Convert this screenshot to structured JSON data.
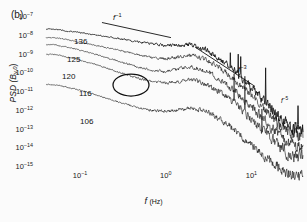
{
  "panel": {
    "label": "(b)"
  },
  "axes": {
    "ylabel_text": "PSD (B",
    "ylabel_sub": "y,0",
    "ylabel_close": ")",
    "xlabel_symbol": "f",
    "xlabel_unit": "(Hz)",
    "yticks": [
      {
        "mantissa": "10",
        "exp": "−7",
        "value": 1e-07
      },
      {
        "mantissa": "10",
        "exp": "−8",
        "value": 1e-08
      },
      {
        "mantissa": "10",
        "exp": "−9",
        "value": 1e-09
      },
      {
        "mantissa": "10",
        "exp": "−10",
        "value": 1e-10
      },
      {
        "mantissa": "10",
        "exp": "−11",
        "value": 1e-11
      },
      {
        "mantissa": "10",
        "exp": "−12",
        "value": 1e-12
      },
      {
        "mantissa": "10",
        "exp": "−13",
        "value": 1e-13
      },
      {
        "mantissa": "10",
        "exp": "−14",
        "value": 1e-14
      },
      {
        "mantissa": "10",
        "exp": "−15",
        "value": 1e-15
      }
    ],
    "xticks": [
      {
        "mantissa": "10",
        "exp": "−1",
        "value": 0.1
      },
      {
        "mantissa": "10",
        "exp": "0",
        "value": 1
      },
      {
        "mantissa": "10",
        "exp": "1",
        "value": 10
      }
    ]
  },
  "curve_labels": [
    {
      "text": "136",
      "x": 74,
      "y": 37
    },
    {
      "text": "125",
      "x": 67,
      "y": 55
    },
    {
      "text": "120",
      "x": 62,
      "y": 72
    },
    {
      "text": "116",
      "x": 79,
      "y": 89
    },
    {
      "text": "106",
      "x": 80,
      "y": 117
    }
  ],
  "slope_annotations": [
    {
      "symbol": "f",
      "exp": "−1",
      "x": 113,
      "y": 12,
      "size": "normal"
    },
    {
      "symbol": "f",
      "exp": "−3",
      "x": 238,
      "y": 64,
      "size": "normal"
    },
    {
      "symbol": "f",
      "exp": "−5",
      "x": 281,
      "y": 96,
      "size": "small"
    }
  ],
  "chart_data": {
    "type": "line",
    "title": "",
    "subtitle": "",
    "panel": "(b)",
    "xlabel": "f (Hz)",
    "ylabel": "PSD (B_y,0)",
    "xscale": "log",
    "yscale": "log",
    "xlim": [
      0.04,
      40
    ],
    "ylim": [
      1e-15,
      1e-07
    ],
    "grid": false,
    "legend_position": "inline-curve-labels",
    "xticklabels": [
      "10^-1",
      "10^0",
      "10^1"
    ],
    "yticklabels": [
      "10^-7",
      "10^-8",
      "10^-9",
      "10^-10",
      "10^-11",
      "10^-12",
      "10^-13",
      "10^-14",
      "10^-15"
    ],
    "noise_note": "all traces are broadband noisy spectra; values are smoothed trend estimates read off the axes",
    "x": [
      0.05,
      0.07,
      0.1,
      0.15,
      0.2,
      0.3,
      0.5,
      0.7,
      1.0,
      1.5,
      2.0,
      3.0,
      5.0,
      7.0,
      10.0,
      15.0,
      20.0,
      30.0
    ],
    "series": [
      {
        "name": "136",
        "label": "136",
        "style": "solid-thick",
        "values": [
          2e-08,
          1.6e-08,
          1.3e-08,
          1e-08,
          8e-09,
          6e-09,
          4e-09,
          3.2e-09,
          2.6e-09,
          2.8e-09,
          3e-09,
          1.5e-09,
          3e-10,
          8e-11,
          1.5e-11,
          2e-12,
          6e-13,
          1e-13
        ]
      },
      {
        "name": "125",
        "label": "125",
        "style": "solid-thin",
        "values": [
          7e-09,
          5.5e-09,
          4e-09,
          2.8e-09,
          2.1e-09,
          1.4e-09,
          8e-10,
          6e-10,
          5e-10,
          7e-10,
          9e-10,
          5e-10,
          1e-10,
          2.5e-11,
          5e-12,
          7e-13,
          2e-13,
          4e-14
        ]
      },
      {
        "name": "120",
        "label": "120",
        "style": "solid-thin",
        "values": [
          3e-09,
          2.2e-09,
          1.5e-09,
          9e-10,
          6e-10,
          3.5e-10,
          1.8e-10,
          1.3e-10,
          1.1e-10,
          1.6e-10,
          2e-10,
          1.2e-10,
          2.5e-11,
          7e-12,
          1.4e-12,
          2e-13,
          6e-14,
          1.2e-14
        ]
      },
      {
        "name": "116",
        "label": "116",
        "style": "solid-thin",
        "values": [
          9e-10,
          6.5e-10,
          4.5e-10,
          2.6e-10,
          1.7e-10,
          9e-11,
          4.5e-11,
          3.2e-11,
          2.6e-11,
          3.4e-11,
          4e-11,
          2.4e-11,
          5.5e-12,
          1.5e-12,
          3e-13,
          5e-14,
          1.5e-14,
          3e-15
        ]
      },
      {
        "name": "106",
        "label": "106",
        "style": "solid-thin",
        "values": [
          2.2e-11,
          1.6e-11,
          1.1e-11,
          6.5e-12,
          4.2e-12,
          2.4e-12,
          1.2e-12,
          9e-13,
          8e-13,
          1e-12,
          1.2e-12,
          8e-13,
          2e-13,
          6e-14,
          1.3e-14,
          2.5e-15,
          1e-15,
          3e-16
        ]
      }
    ],
    "reference_lines": [
      {
        "label": "f^-1",
        "slope": -1,
        "x_range": [
          0.18,
          1.15
        ],
        "y_start": 4.5e-08
      },
      {
        "label": "f^-3",
        "slope": -3,
        "x_range": [
          2.2,
          11.0
        ],
        "y_start": 2.2e-09
      },
      {
        "label": "f^-5",
        "slope": -5,
        "annotation_only": true
      }
    ],
    "annotations": [
      {
        "type": "ellipse",
        "note": "circled feature on the 116 trace",
        "cx": 0.55,
        "cy": 1e-10
      }
    ]
  }
}
